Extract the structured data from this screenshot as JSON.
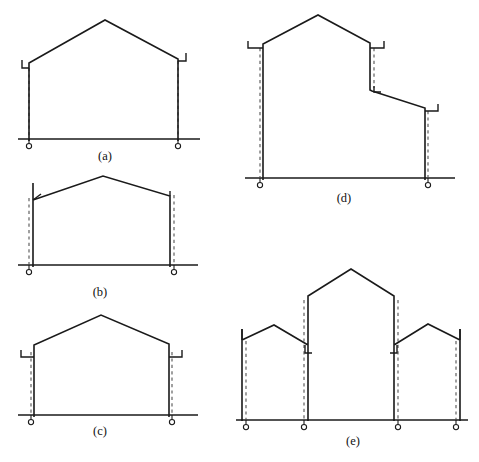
{
  "page": {
    "width": 479,
    "height": 462,
    "background": "#ffffff",
    "line_color": "#1a1a1a",
    "dashed_color": "#4a4a4a"
  },
  "figures": [
    {
      "id": "a",
      "caption": "(a)",
      "caption_x": 105,
      "caption_y": 160,
      "description": "Symmetric pitched portal frame with two pinned bases and haunch brackets at eaves",
      "ground": {
        "x1": 18,
        "x2": 200,
        "y": 139
      },
      "frame_path": "M 29 141 L 29 63 L 105 20 L 178 59 L 178 141",
      "brackets": [
        {
          "name": "left-eave-bracket",
          "path": "M 22 60 L 22 68 L 29 68"
        },
        {
          "name": "right-eave-bracket",
          "path": "M 186 53 L 186 61 L 178 61"
        }
      ],
      "hinge_lines": [
        {
          "name": "left-column-hinge-line",
          "x1": 29,
          "y1": 68,
          "x2": 29,
          "y2": 139
        },
        {
          "name": "right-column-hinge-line",
          "x1": 178,
          "y1": 61,
          "x2": 178,
          "y2": 139
        }
      ],
      "supports": [
        {
          "name": "left-pin-support",
          "x": 29,
          "y": 139
        },
        {
          "name": "right-pin-support",
          "x": 178,
          "y": 139
        }
      ]
    },
    {
      "id": "b",
      "caption": "(b)",
      "caption_x": 100,
      "caption_y": 296,
      "description": "Shallow pitched frame with columns continuing above eave connections",
      "ground": {
        "x1": 18,
        "x2": 198,
        "y": 265
      },
      "frame_path": "M 33 267 L 33 183 M 33 200 L 103 176 L 170 196 L 170 267",
      "brackets": [
        {
          "name": "left-eave-tick",
          "path": "M 33 200 L 41 194"
        },
        {
          "name": "right-column-top",
          "path": "M 170 191 L 170 196"
        }
      ],
      "hinge_lines": [
        {
          "name": "left-column-hinge-line",
          "x1": 29,
          "y1": 198,
          "x2": 29,
          "y2": 265
        },
        {
          "name": "right-column-hinge-line",
          "x1": 174,
          "y1": 195,
          "x2": 174,
          "y2": 265
        }
      ],
      "supports": [
        {
          "name": "left-pin-support",
          "x": 29,
          "y": 265
        },
        {
          "name": "right-pin-support",
          "x": 174,
          "y": 265
        }
      ]
    },
    {
      "id": "c",
      "caption": "(c)",
      "caption_x": 100,
      "caption_y": 435,
      "description": "Low-rise pitched portal frame with eave brackets and pinned bases",
      "ground": {
        "x1": 18,
        "x2": 198,
        "y": 415
      },
      "frame_path": "M 34 417 L 34 345 L 101 315 L 169 344 L 169 417",
      "brackets": [
        {
          "name": "left-eave-bracket",
          "path": "M 21 350 L 21 357 L 34 357"
        },
        {
          "name": "right-eave-bracket",
          "path": "M 182 350 L 182 357 L 169 357"
        }
      ],
      "hinge_lines": [
        {
          "name": "left-column-hinge-line",
          "x1": 31,
          "y1": 352,
          "x2": 31,
          "y2": 415
        },
        {
          "name": "right-column-hinge-line",
          "x1": 172,
          "y1": 352,
          "x2": 172,
          "y2": 415
        }
      ],
      "supports": [
        {
          "name": "left-pin-support",
          "x": 31,
          "y": 415
        },
        {
          "name": "right-pin-support",
          "x": 172,
          "y": 415
        }
      ]
    },
    {
      "id": "d",
      "caption": "(d)",
      "caption_x": 344,
      "caption_y": 202,
      "description": "Asymmetric stepped frame: tall gable bay on the left dropping to a lower lean-to bay on the right",
      "ground": {
        "x1": 245,
        "x2": 455,
        "y": 178
      },
      "frame_path": "M 263 180 L 263 44 L 318 15 L 370 43 L 370 90 L 372 91 L 425 108 L 425 180",
      "brackets": [
        {
          "name": "left-eave-bracket",
          "path": "M 248 41 L 248 48 L 263 48"
        },
        {
          "name": "upper-step-bracket",
          "path": "M 384 41 L 384 48 L 370 48"
        },
        {
          "name": "step-foot-hook",
          "path": "M 374 86 L 374 92 L 381 92"
        },
        {
          "name": "right-eave-bracket",
          "path": "M 438 104 L 438 111 L 425 111"
        }
      ],
      "hinge_lines": [
        {
          "name": "left-column-hinge-line",
          "x1": 260,
          "y1": 48,
          "x2": 260,
          "y2": 178
        },
        {
          "name": "step-column-hinge-line",
          "x1": 374,
          "y1": 48,
          "x2": 374,
          "y2": 88
        },
        {
          "name": "right-column-hinge-line",
          "x1": 428,
          "y1": 111,
          "x2": 428,
          "y2": 178
        }
      ],
      "supports": [
        {
          "name": "left-pin-support",
          "x": 260,
          "y": 178
        },
        {
          "name": "right-pin-support",
          "x": 428,
          "y": 178
        }
      ]
    },
    {
      "id": "e",
      "caption": "(e)",
      "caption_x": 353,
      "caption_y": 445,
      "description": "Three-bay multi-span frame: low outer gables flanking a tall central gable, four pinned bases",
      "ground": {
        "x1": 236,
        "x2": 468,
        "y": 420
      },
      "frame_path": "M 242 421 L 242 329 M 242 340 L 274 325 L 308 345 M 308 421 L 308 296 L 351 269 L 394 296 L 394 421 M 394 345 L 428 324 L 460 340 M 460 329 L 460 421",
      "brackets": [
        {
          "name": "left-outer-column-top",
          "path": "M 242 329 L 242 340"
        },
        {
          "name": "left-inner-hook",
          "path": "M 305 345 L 305 353 L 312 353"
        },
        {
          "name": "right-inner-hook",
          "path": "M 397 345 L 397 353 L 390 353"
        },
        {
          "name": "right-outer-column-top",
          "path": "M 460 329 L 460 340"
        }
      ],
      "hinge_lines": [
        {
          "name": "bay1-left-hinge-line",
          "x1": 246,
          "y1": 341,
          "x2": 246,
          "y2": 420
        },
        {
          "name": "bay1-right-hinge-line",
          "x1": 304,
          "y1": 300,
          "x2": 304,
          "y2": 420
        },
        {
          "name": "bay2-right-hinge-line",
          "x1": 398,
          "y1": 300,
          "x2": 398,
          "y2": 420
        },
        {
          "name": "bay3-right-hinge-line",
          "x1": 456,
          "y1": 341,
          "x2": 456,
          "y2": 420
        }
      ],
      "supports": [
        {
          "name": "pin-support-1",
          "x": 246,
          "y": 420
        },
        {
          "name": "pin-support-2",
          "x": 304,
          "y": 420
        },
        {
          "name": "pin-support-3",
          "x": 398,
          "y": 420
        },
        {
          "name": "pin-support-4",
          "x": 456,
          "y": 420
        }
      ]
    }
  ],
  "support_symbol": {
    "name": "pin-support-symbol",
    "circle_radius": 2.6,
    "stem_length": 4.5,
    "description": "small open circle below ground line with short vertical stem"
  },
  "chart_data": {
    "type": "diagram",
    "subfigures": [
      "(a)",
      "(b)",
      "(c)",
      "(d)",
      "(e)"
    ]
  }
}
